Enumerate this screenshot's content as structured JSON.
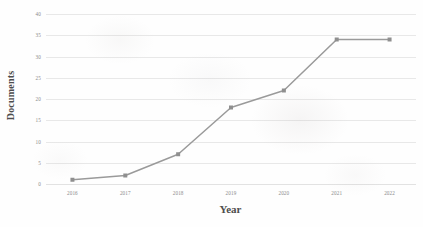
{
  "chart_data": {
    "type": "line",
    "title": "",
    "xlabel": "Year",
    "ylabel": "Documents",
    "categories": [
      "2016",
      "2017",
      "2018",
      "2019",
      "2020",
      "2021",
      "2022"
    ],
    "values": [
      1,
      2,
      7,
      18,
      22,
      34,
      34
    ],
    "series": [
      {
        "name": "Documents",
        "values": [
          1,
          2,
          7,
          18,
          22,
          34,
          34
        ]
      }
    ],
    "ylim": [
      0,
      40
    ],
    "yticks": [
      0,
      5,
      10,
      15,
      20,
      25,
      30,
      35,
      40
    ],
    "ytick_labels": [
      "0",
      "5",
      "10",
      "15",
      "20",
      "25",
      "30",
      "35",
      "40"
    ],
    "xtick_labels": [
      "2016",
      "2017",
      "2018",
      "2019",
      "2020",
      "2021",
      "2022"
    ],
    "grid": "horizontal",
    "legend": "none",
    "line_color": "#9a9a9a",
    "marker_color": "#8f8f8f",
    "grid_color": "#e8e8e8",
    "background": "#fefefe"
  }
}
